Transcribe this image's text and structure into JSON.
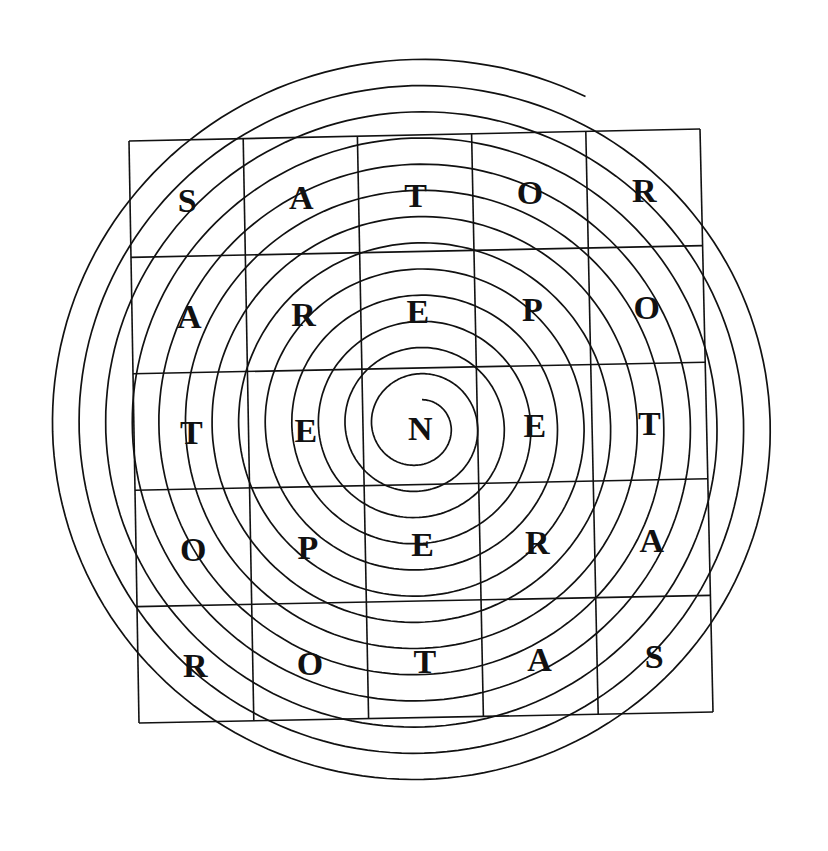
{
  "figure": {
    "rows": [
      [
        "S",
        "A",
        "T",
        "O",
        "R"
      ],
      [
        "A",
        "R",
        "E",
        "P",
        "O"
      ],
      [
        "T",
        "E",
        "N",
        "E",
        "T"
      ],
      [
        "O",
        "P",
        "E",
        "R",
        "A"
      ],
      [
        "R",
        "O",
        "T",
        "A",
        "S"
      ]
    ],
    "words": [
      "SATOR",
      "AREPO",
      "TENET",
      "OPERA",
      "ROTAS"
    ],
    "center_letter": "N",
    "colors": {
      "ink": "#111111",
      "background": "#ffffff"
    }
  }
}
